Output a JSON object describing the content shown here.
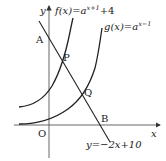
{
  "diagram": {
    "type": "function-graph",
    "axes": {
      "x_label": "x",
      "y_label": "y",
      "origin_label": "O"
    },
    "curves": [
      {
        "name": "f",
        "label": "f(x)=a^(x+1)+4",
        "label_prefix": "f(x)=a",
        "label_exp": "x+1",
        "label_suffix": "+4"
      },
      {
        "name": "g",
        "label": "g(x)=a^(x-1)",
        "label_prefix": "g(x)=a",
        "label_exp": "x−1",
        "label_suffix": ""
      }
    ],
    "line": {
      "label": "y=−2x+10"
    },
    "points": [
      {
        "name": "A",
        "desc": "intersection of line with y-axis"
      },
      {
        "name": "P",
        "desc": "intersection of line with f"
      },
      {
        "name": "Q",
        "desc": "intersection of line with g"
      },
      {
        "name": "B",
        "desc": "intersection of line with x-axis"
      }
    ],
    "colors": {
      "stroke": "#222222",
      "axis": "#555555",
      "background": "#ffffff"
    }
  }
}
